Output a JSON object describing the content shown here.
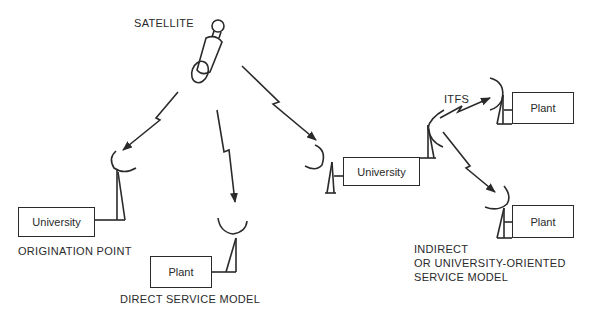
{
  "diagram": {
    "satellite": {
      "label": "SATELLITE",
      "icon": "satellite-icon"
    },
    "origination": {
      "box_label": "University",
      "caption": "ORIGINATION POINT"
    },
    "direct": {
      "box_label": "Plant",
      "caption": "DIRECT SERVICE MODEL"
    },
    "indirect": {
      "hub_label": "University",
      "link_label": "ITFS",
      "plant_top_label": "Plant",
      "plant_bottom_label": "Plant",
      "caption_lines": [
        "INDIRECT",
        "OR UNIVERSITY-ORIENTED",
        "SERVICE MODEL"
      ]
    },
    "colors": {
      "ink": "#2a2a2a",
      "background": "#ffffff"
    }
  }
}
